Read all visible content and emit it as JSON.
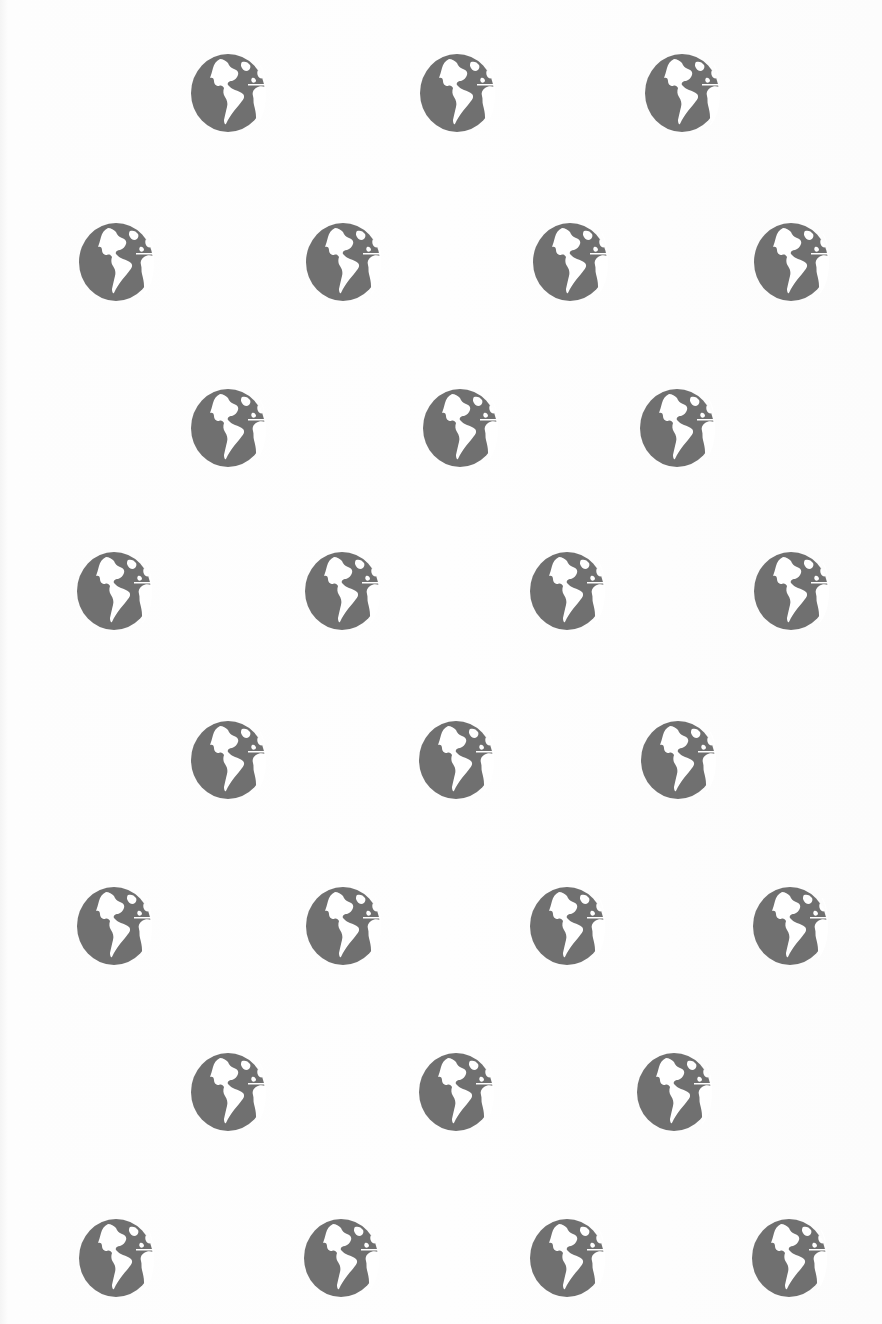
{
  "pattern": {
    "icon": "globe-icon",
    "icon_color": "#707070",
    "land_color": "#ffffff",
    "background_color": "#fdfdfd",
    "icon_size": {
      "width": 76,
      "height": 80
    },
    "rows": [
      {
        "y": 93,
        "x": [
          228,
          457,
          682
        ]
      },
      {
        "y": 262,
        "x": [
          116,
          343,
          570,
          791
        ]
      },
      {
        "y": 428,
        "x": [
          228,
          460,
          677
        ]
      },
      {
        "y": 591,
        "x": [
          114,
          342,
          567,
          791
        ]
      },
      {
        "y": 760,
        "x": [
          228,
          456,
          678
        ]
      },
      {
        "y": 926,
        "x": [
          114,
          343,
          567,
          790
        ]
      },
      {
        "y": 1092,
        "x": [
          228,
          456,
          674
        ]
      },
      {
        "y": 1258,
        "x": [
          116,
          341,
          567,
          789
        ]
      }
    ]
  }
}
